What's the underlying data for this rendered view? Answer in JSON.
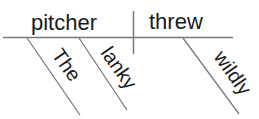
{
  "diagram": {
    "type": "sentence-diagram",
    "subject": "pitcher",
    "verb": "threw",
    "subject_modifiers": [
      "The",
      "lanky"
    ],
    "verb_modifiers": [
      "wildly"
    ],
    "colors": {
      "line": "#7a7a7a",
      "text": "#1a1a1a",
      "background": "#ffffff"
    }
  }
}
